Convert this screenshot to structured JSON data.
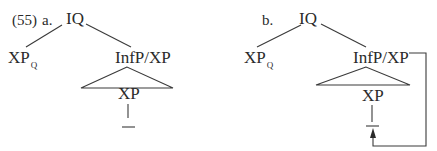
{
  "example_number": "(55)",
  "trees": [
    {
      "label": "a.",
      "root": "IQ",
      "left_child": {
        "text": "XP",
        "subscript": "Q"
      },
      "right_child": "InfP/XP",
      "triangle_label": "XP",
      "gap_marker": "—",
      "has_movement_arrow": false
    },
    {
      "label": "b.",
      "root": "IQ",
      "left_child": {
        "text": "XP",
        "subscript": "Q"
      },
      "right_child": "InfP/XP",
      "triangle_label": "XP",
      "gap_marker": "—",
      "has_movement_arrow": true
    }
  ],
  "colors": {
    "line": "#3a3a3a",
    "text": "#2a2a2a",
    "background": "#ffffff"
  }
}
